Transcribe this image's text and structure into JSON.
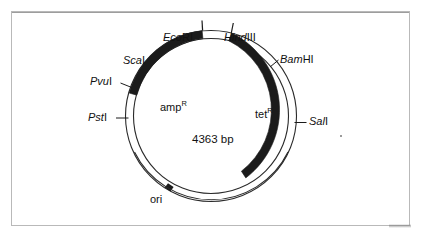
{
  "figure": {
    "kind": "plasmid-map",
    "center_label": "4363 bp",
    "genes": [
      {
        "id": "ampR",
        "text_prefix": "amp",
        "text_sup": "R"
      },
      {
        "id": "tetR",
        "text_prefix": "tet",
        "text_sup": "R"
      }
    ],
    "origin": {
      "label": "ori"
    },
    "sites": [
      {
        "id": "ecori",
        "italic": "Eco",
        "roman": "RI"
      },
      {
        "id": "hindiii",
        "italic": "Hind",
        "roman": "III"
      },
      {
        "id": "bamhi",
        "italic": "Bam",
        "roman": "HI"
      },
      {
        "id": "sali",
        "italic": "Sal",
        "roman": "I"
      },
      {
        "id": "psti",
        "italic": "Pst",
        "roman": "I"
      },
      {
        "id": "pvui",
        "italic": "Pvu",
        "roman": "I"
      },
      {
        "id": "scai",
        "italic": "Sca",
        "roman": "I"
      }
    ],
    "colors": {
      "gene_fill": "#1b1b1b",
      "backbone_stroke": "#2a2a2a",
      "backbone_fill": "#ffffff",
      "frame_border": "#b9b9b9",
      "text": "#111111",
      "page_background": "#ffffff"
    }
  }
}
